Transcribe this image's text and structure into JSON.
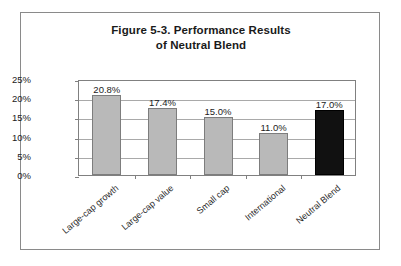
{
  "figure": {
    "title_line_1": "Figure 5-3.  Performance Results",
    "title_line_2": "of Neutral Blend"
  },
  "chart_data": {
    "type": "bar",
    "title": "Figure 5-3. Performance Results of Neutral Blend",
    "xlabel": "",
    "ylabel": "",
    "categories": [
      "Large-cap growth",
      "Large-cap value",
      "Small cap",
      "International",
      "Neutral Blend"
    ],
    "values": [
      20.8,
      17.4,
      15.0,
      11.0,
      17.0
    ],
    "value_labels": [
      "20.8%",
      "17.4%",
      "15.0%",
      "11.0%",
      "17.0%"
    ],
    "bar_colors": [
      "#b9b9b9",
      "#b9b9b9",
      "#b9b9b9",
      "#b9b9b9",
      "#111111"
    ],
    "ylim": [
      0,
      25
    ],
    "ytick_values": [
      25,
      20,
      15,
      10,
      5,
      0
    ],
    "ytick_labels": [
      "25%",
      "20%",
      "15%",
      "10%",
      "5%",
      "0%"
    ],
    "grid": true,
    "legend": "none"
  },
  "colors": {
    "frame_border": "#8a8a8a",
    "plot_border": "#808080",
    "gridline": "#a9a9a9",
    "bar_gray_fill": "#b9b9b9",
    "bar_gray_border": "#7d7d7d",
    "bar_black_fill": "#111111",
    "text": "#1a1a1a",
    "background": "#ffffff"
  }
}
